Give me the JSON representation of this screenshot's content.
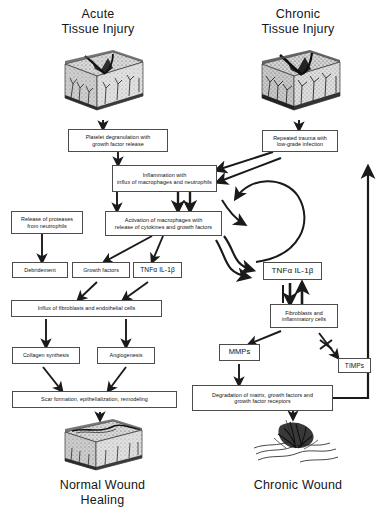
{
  "figure": {
    "type": "flow-diagram",
    "ink_color": "#1a1a1a",
    "box_border_color": "#4c4c4c",
    "background": "#ffffff"
  },
  "headers": {
    "left_line1": "Acute",
    "left_line2": "Tissue Injury",
    "right_line1": "Chronic",
    "right_line2": "Tissue Injury"
  },
  "footers": {
    "left_line1": "Normal Wound",
    "left_line2": "Healing",
    "right_line1": "Chronic Wound",
    "right_line2": ""
  },
  "nodes": {
    "platelet": {
      "line1": "Platelet degranulation with",
      "line2": "growth factor release"
    },
    "repeated_trauma": {
      "line1": "Repeated trauma with",
      "line2": "low-grade infection"
    },
    "inflammation": {
      "line1": "Inflammation with",
      "line2": "influx of macrophages and neutrophils"
    },
    "proteases": {
      "line1": "Release of proteases",
      "line2": "from neutrophils"
    },
    "activation": {
      "line1": "Activation of macrophages with",
      "line2": "release of cytokines and growth factors"
    },
    "debridement": {
      "label": "Debridement"
    },
    "growth_factors": {
      "label": "Growth factors"
    },
    "tnf_left": {
      "label": "TNFα IL-1β"
    },
    "tnf_right": {
      "label": "TNFα IL-1β"
    },
    "influx": {
      "label": "Influx of fibroblasts and endothelial cells"
    },
    "collagen": {
      "label": "Collagen synthesis"
    },
    "angiogenesis": {
      "label": "Angiogenesis"
    },
    "scar": {
      "label": "Scar formation, epithelialization, remodeling"
    },
    "fibroblasts": {
      "line1": "Fibroblasts and",
      "line2": "inflammatory cells"
    },
    "mmps": {
      "label": "MMPs"
    },
    "timps": {
      "label": "TIMPs"
    },
    "degradation": {
      "line1": "Degradation of matrix, growth factors and",
      "line2": "growth factor receptors"
    }
  },
  "illustrations": {
    "top_left": "acute-tissue-injury-block",
    "top_right": "chronic-tissue-injury-block",
    "bottom_left": "healed-wound-block",
    "bottom_right": "chronic-wound-block"
  },
  "edges": [
    {
      "from": "top_left_tissue",
      "to": "platelet",
      "style": "arrow"
    },
    {
      "from": "platelet",
      "to": "inflammation",
      "style": "arrow"
    },
    {
      "from": "top_right_tissue",
      "to": "repeated_trauma",
      "style": "arrow"
    },
    {
      "from": "repeated_trauma",
      "to": "inflammation",
      "style": "arrow"
    },
    {
      "from": "inflammation",
      "to": "proteases",
      "style": "arrow"
    },
    {
      "from": "inflammation",
      "to": "activation",
      "style": "double-arrow"
    },
    {
      "from": "proteases",
      "to": "debridement",
      "style": "arrow"
    },
    {
      "from": "activation",
      "to": "growth_factors",
      "style": "arrow"
    },
    {
      "from": "activation",
      "to": "tnf_left",
      "style": "arrow"
    },
    {
      "from": "activation",
      "to": "tnf_right",
      "style": "curved-arrow"
    },
    {
      "from": "inflammation",
      "to": "tnf_right",
      "style": "curved-loop-arrow"
    },
    {
      "from": "tnf_right",
      "to": "inflammation",
      "style": "curved-loop-arrow"
    },
    {
      "from": "growth_factors",
      "to": "influx",
      "style": "arrow"
    },
    {
      "from": "tnf_left",
      "to": "influx",
      "style": "arrow"
    },
    {
      "from": "influx",
      "to": "collagen",
      "style": "arrow"
    },
    {
      "from": "influx",
      "to": "angiogenesis",
      "style": "arrow"
    },
    {
      "from": "collagen",
      "to": "scar",
      "style": "arrow"
    },
    {
      "from": "angiogenesis",
      "to": "scar",
      "style": "arrow"
    },
    {
      "from": "scar",
      "to": "bottom_left_tissue",
      "style": "arrow"
    },
    {
      "from": "tnf_right",
      "to": "fibroblasts",
      "style": "double-arrow"
    },
    {
      "from": "fibroblasts",
      "to": "tnf_right",
      "style": "double-arrow"
    },
    {
      "from": "fibroblasts",
      "to": "mmps",
      "style": "arrow"
    },
    {
      "from": "fibroblasts",
      "to": "timps",
      "style": "inhibited-arrow"
    },
    {
      "from": "mmps",
      "to": "degradation",
      "style": "arrow"
    },
    {
      "from": "degradation",
      "to": "repeated_trauma",
      "style": "elbow-arrow"
    },
    {
      "from": "degradation",
      "to": "bottom_right_tissue",
      "style": "arrow"
    }
  ]
}
